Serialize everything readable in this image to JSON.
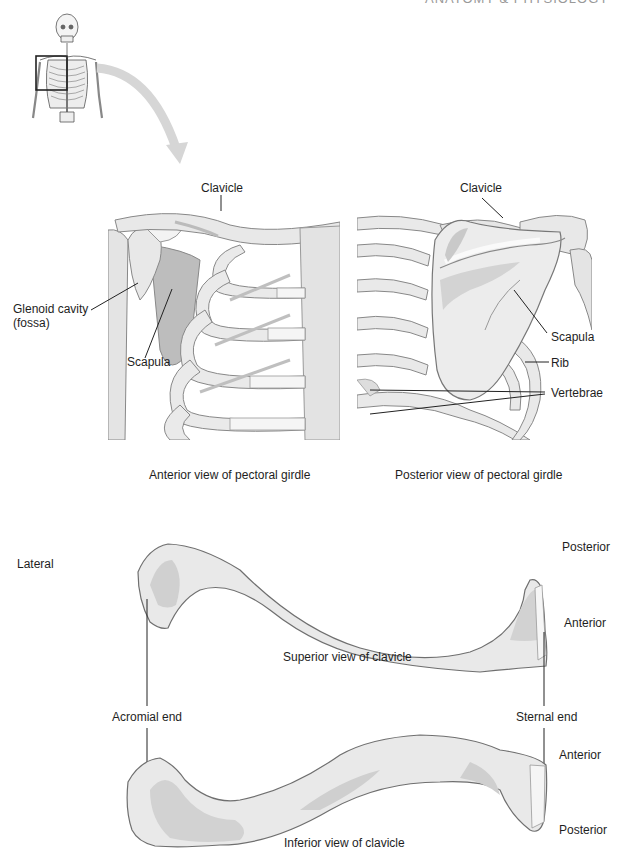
{
  "header": {
    "cut_text": "ANATOMY & PHYSIOLOGY"
  },
  "thumbnail": {
    "icon": "skeleton-icon",
    "highlight": "right-shoulder-region"
  },
  "anterior_view": {
    "caption": "Anterior view of pectoral girdle",
    "labels": {
      "clavicle": "Clavicle",
      "glenoid_line1": "Glenoid cavity",
      "glenoid_line2": "(fossa)",
      "scapula": "Scapula"
    }
  },
  "posterior_view": {
    "caption": "Posterior view of pectoral girdle",
    "labels": {
      "clavicle": "Clavicle",
      "scapula": "Scapula",
      "rib": "Rib",
      "vertebrae": "Vertebrae"
    }
  },
  "superior_clavicle": {
    "caption": "Superior view of clavicle",
    "labels": {
      "lateral": "Lateral",
      "posterior": "Posterior",
      "anterior": "Anterior"
    }
  },
  "end_labels": {
    "acromial": "Acromial end",
    "sternal": "Sternal end"
  },
  "inferior_clavicle": {
    "caption": "Inferior view of clavicle",
    "labels": {
      "anterior": "Anterior",
      "posterior": "Posterior"
    }
  },
  "colors": {
    "bone_fill": "#e9e9e9",
    "bone_shade": "#c9c9c9",
    "bone_dark": "#a9a9a9",
    "outline": "#6f6f6f",
    "leader_line": "#222222",
    "arrow": "#d8d8d8"
  }
}
